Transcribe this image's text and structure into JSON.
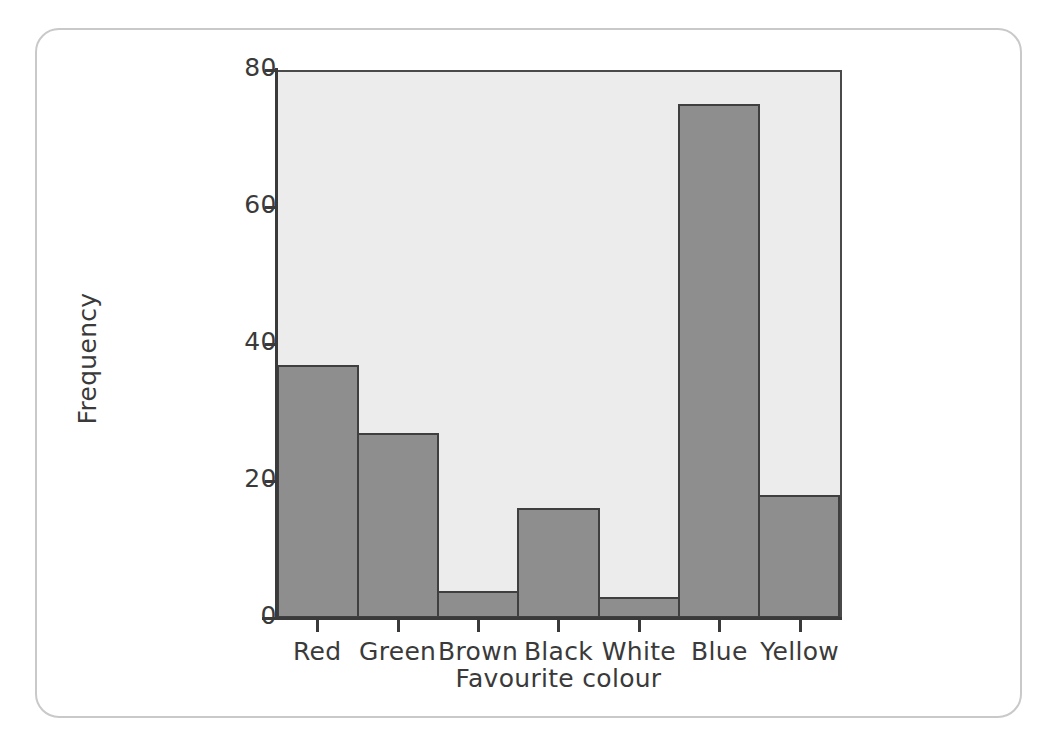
{
  "figure": {
    "frame_color": "#c9c9c9",
    "background_color": "#ffffff"
  },
  "chart_data": {
    "type": "bar",
    "title": "",
    "subtitle": "",
    "xlabel": "Favourite colour",
    "ylabel": "Frequency",
    "categories": [
      "Red",
      "Green",
      "Brown",
      "Black",
      "White",
      "Blue",
      "Yellow"
    ],
    "values": [
      37,
      27,
      4,
      16,
      3,
      75,
      18
    ],
    "ylim": [
      0,
      80
    ],
    "y_ticks": [
      0,
      20,
      40,
      60,
      80
    ],
    "y_tick_labels": [
      "0",
      "20",
      "40",
      "60",
      "80"
    ],
    "x_tick_labels": [
      "Red",
      "Green",
      "Brown",
      "Black",
      "White",
      "Blue",
      "Yellow"
    ],
    "grid": false,
    "legend": false,
    "legend_position": "none",
    "bar_fill_color": "#8e8e8e",
    "bar_edge_color": "#3f3f3f",
    "plot_background_color": "#ececec",
    "axis_color": "#3a3a3a",
    "bars_adjacent": true
  }
}
